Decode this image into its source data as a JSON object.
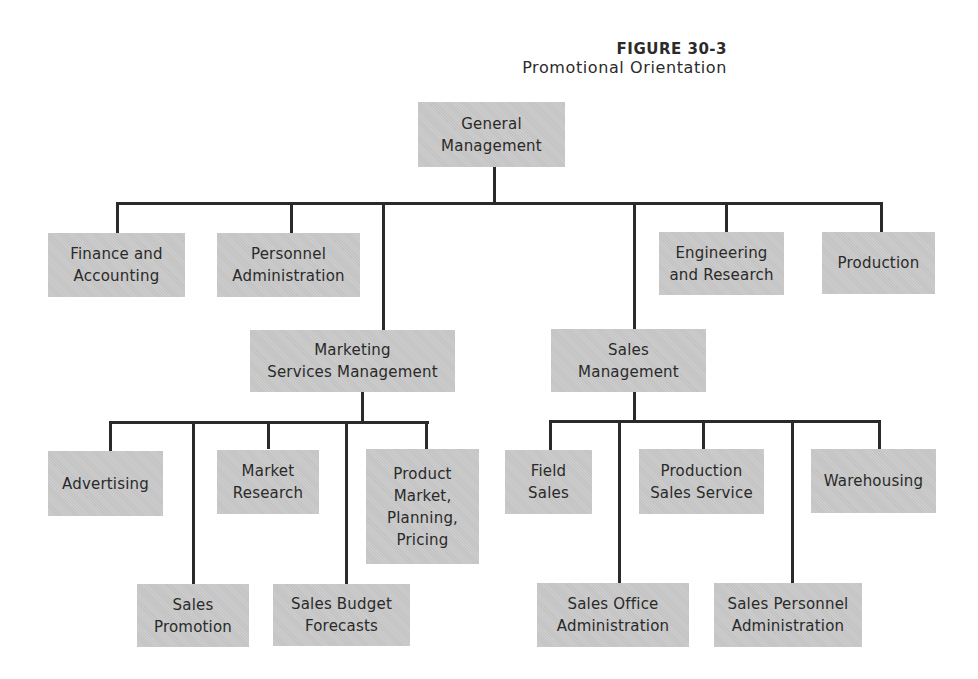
{
  "figure": {
    "number": "FIGURE 30-3",
    "title": "Promotional Orientation"
  },
  "chart": {
    "top": {
      "label": "General\nManagement"
    },
    "level1": [
      {
        "label": "Finance and\nAccounting"
      },
      {
        "label": "Personnel\nAdministration"
      },
      {
        "label": "Engineering\nand Research"
      },
      {
        "label": "Production"
      }
    ],
    "marketing": {
      "label": "Marketing\nServices Management",
      "children": [
        {
          "label": "Advertising"
        },
        {
          "label": "Sales\nPromotion"
        },
        {
          "label": "Market\nResearch"
        },
        {
          "label": "Sales Budget\nForecasts"
        },
        {
          "label": "Product\nMarket,\nPlanning,\nPricing"
        }
      ]
    },
    "sales": {
      "label": "Sales\nManagement",
      "children": [
        {
          "label": "Field\nSales"
        },
        {
          "label": "Sales Office\nAdministration"
        },
        {
          "label": "Production\nSales Service"
        },
        {
          "label": "Sales Personnel\nAdministration"
        },
        {
          "label": "Warehousing"
        }
      ]
    }
  },
  "colors": {
    "box_fill": "#c9c9c9",
    "line": "#2a2a2a",
    "text": "#2a2a2a"
  }
}
